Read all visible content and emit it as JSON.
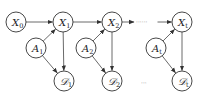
{
  "diagram": {
    "title": "",
    "nodes": [
      {
        "id": "X0",
        "base": "X",
        "sub": "0",
        "script": false
      },
      {
        "id": "X1",
        "base": "X",
        "sub": "1",
        "script": false
      },
      {
        "id": "X2",
        "base": "X",
        "sub": "2",
        "script": false
      },
      {
        "id": "Xt",
        "base": "X",
        "sub": "t",
        "script": false
      },
      {
        "id": "A1",
        "base": "A",
        "sub": "1",
        "script": false
      },
      {
        "id": "A2",
        "base": "A",
        "sub": "2",
        "script": false
      },
      {
        "id": "At",
        "base": "A",
        "sub": "t",
        "script": false
      },
      {
        "id": "D1",
        "base": "𝒟",
        "sub": "1",
        "script": true
      },
      {
        "id": "D2",
        "base": "𝒟",
        "sub": "2",
        "script": true
      },
      {
        "id": "Dt",
        "base": "𝒟",
        "sub": "t",
        "script": true
      }
    ],
    "edges": [
      {
        "from": "X0",
        "to": "X1"
      },
      {
        "from": "X1",
        "to": "X2"
      },
      {
        "from": "X2",
        "to": "Xt",
        "dashed_middle": true
      },
      {
        "from": "A1",
        "to": "X1"
      },
      {
        "from": "A2",
        "to": "X2"
      },
      {
        "from": "At",
        "to": "Xt"
      },
      {
        "from": "A1",
        "to": "D1"
      },
      {
        "from": "A2",
        "to": "D2"
      },
      {
        "from": "At",
        "to": "Dt"
      },
      {
        "from": "X1",
        "to": "D1"
      },
      {
        "from": "X2",
        "to": "D2"
      },
      {
        "from": "Xt",
        "to": "Dt"
      }
    ],
    "ellipsis_top": "······",
    "ellipsis_bottom": "···"
  }
}
